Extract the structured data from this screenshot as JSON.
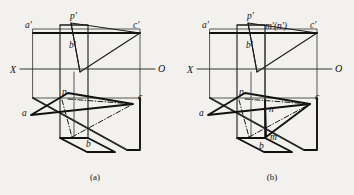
{
  "figure": {
    "background_color": "#f2f1ee",
    "ink_color": "#111111",
    "panels": [
      {
        "id": "a",
        "caption": "(a)",
        "labels": {
          "axis_x": "X",
          "axis_o": "O",
          "a_prime": "a'",
          "b_prime": "b'",
          "c_prime": "c'",
          "p_prime": "p'",
          "a": "a",
          "b": "b",
          "c": "c",
          "p": "p"
        }
      },
      {
        "id": "b",
        "caption": "(b)",
        "labels": {
          "axis_x": "X",
          "axis_o": "O",
          "a_prime": "a'",
          "b_prime": "b'",
          "c_prime": "c'",
          "p_prime": "p'",
          "mn_prime": "m'(n')",
          "a": "a",
          "b": "b",
          "c": "c",
          "p": "p",
          "m": "m",
          "n": "n"
        }
      }
    ]
  }
}
